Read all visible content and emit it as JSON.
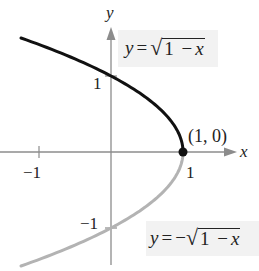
{
  "figure": {
    "axes": {
      "x_label": "x",
      "y_label": "y",
      "x_ticks": [
        {
          "value": -1,
          "label": "−1"
        },
        {
          "value": 1,
          "label": "1"
        }
      ],
      "y_ticks": [
        {
          "value": 1,
          "label": "1"
        },
        {
          "value": -1,
          "label": "−1"
        }
      ]
    },
    "curves": [
      {
        "name": "upper",
        "equation": {
          "lhs": "y",
          "eq": "=",
          "sign": "",
          "radicand_num": "1",
          "radicand_op": "−",
          "radicand_var": "x"
        },
        "color": "#111111"
      },
      {
        "name": "lower",
        "equation": {
          "lhs": "y",
          "eq": "=",
          "sign": "−",
          "radicand_num": "1",
          "radicand_op": "−",
          "radicand_var": "x"
        },
        "color": "#b3b3b3"
      }
    ],
    "point": {
      "label": "(1, 0)",
      "x": 1,
      "y": 0,
      "color": "#111111"
    },
    "colors": {
      "axis": "#8c8c8c",
      "label_box": "#f2f2f2"
    }
  }
}
